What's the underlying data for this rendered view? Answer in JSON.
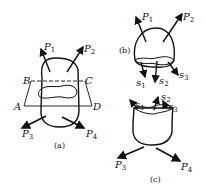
{
  "figure_a": {
    "caption": "(a)",
    "forces": [
      {
        "base": "P",
        "sub": "1"
      },
      {
        "base": "P",
        "sub": "2"
      },
      {
        "base": "P",
        "sub": "3"
      },
      {
        "base": "P",
        "sub": "4"
      }
    ],
    "plane_corners": [
      "A",
      "B",
      "C",
      "D"
    ]
  },
  "figure_b": {
    "caption": "(b)",
    "forces": [
      {
        "base": "P",
        "sub": "1"
      },
      {
        "base": "P",
        "sub": "2"
      }
    ],
    "stresses": [
      {
        "base": "s",
        "sub": "1"
      },
      {
        "base": "s",
        "sub": "2"
      },
      {
        "base": "s",
        "sub": "3"
      }
    ]
  },
  "figure_c": {
    "caption": "(c)",
    "forces": [
      {
        "base": "P",
        "sub": "3"
      },
      {
        "base": "P",
        "sub": "4"
      }
    ],
    "stresses": [
      {
        "base": "s",
        "sub": "1"
      },
      {
        "base": "s",
        "sub": "2"
      },
      {
        "base": "s",
        "sub": "3"
      }
    ]
  }
}
